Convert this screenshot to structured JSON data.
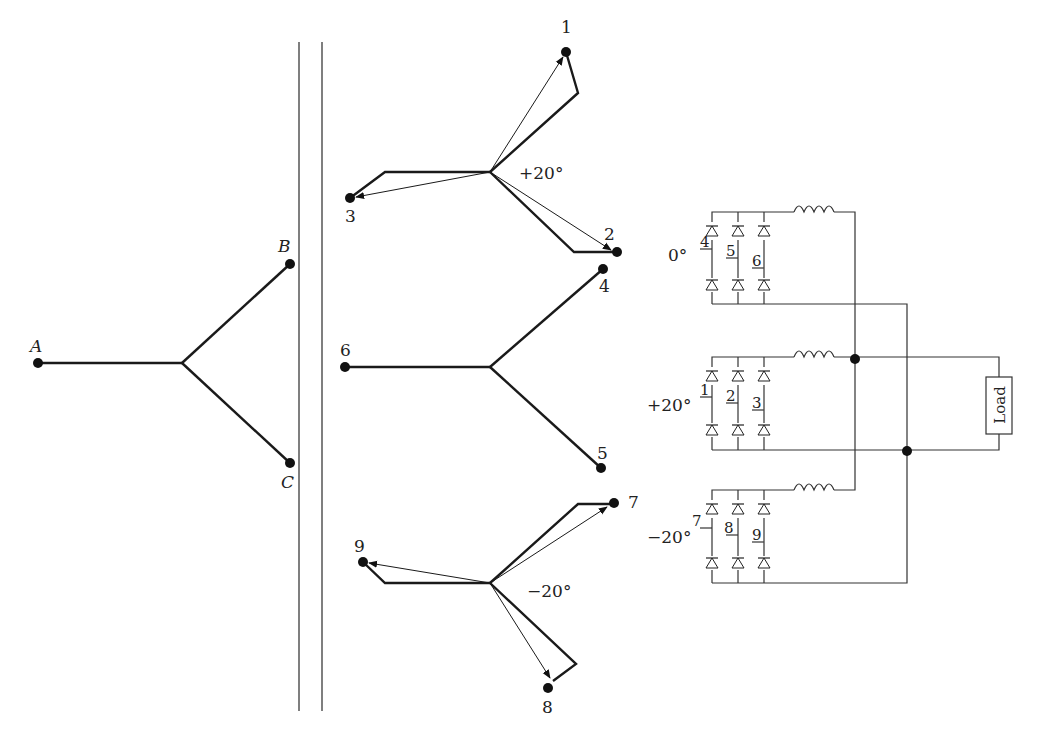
{
  "figure": {
    "primary_winding": {
      "terminals": [
        "A",
        "B",
        "C"
      ]
    },
    "secondary_windings": [
      {
        "id": "plus20",
        "shift_label": "+20°",
        "terminals": [
          "1",
          "2",
          "3"
        ]
      },
      {
        "id": "zero",
        "shift_label": "0°",
        "terminals": [
          "4",
          "5",
          "6"
        ]
      },
      {
        "id": "minus20",
        "shift_label": "−20°",
        "terminals": [
          "7",
          "8",
          "9"
        ]
      }
    ],
    "rectifier_bridges": [
      {
        "shift_label": "0°",
        "inputs": [
          "4",
          "5",
          "6"
        ]
      },
      {
        "shift_label": "+20°",
        "inputs": [
          "1",
          "2",
          "3"
        ]
      },
      {
        "shift_label": "−20°",
        "inputs": [
          "7",
          "8",
          "9"
        ]
      }
    ],
    "load_label": "Load"
  }
}
